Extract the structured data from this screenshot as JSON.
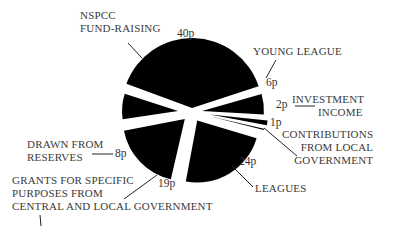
{
  "chart_data": {
    "type": "pie",
    "title": "",
    "unit": "p",
    "exploded": true,
    "categories": [
      "NSPCC FUND-RAISING",
      "YOUNG LEAGUE",
      "INVESTMENT INCOME",
      "CONTRIBUTIONS FROM LOCAL GOVERNMENT",
      "LEAGUES",
      "GRANTS FOR SPECIFIC PURPOSES FROM CENTRAL AND LOCAL GOVERNMENT",
      "DRAWN FROM RESERVES"
    ],
    "values": [
      40,
      6,
      2,
      1,
      24,
      19,
      8
    ],
    "value_labels": [
      "40p",
      "6p",
      "2p",
      "1p",
      "24p",
      "19p",
      "8p"
    ],
    "color": "#000000"
  },
  "labels": {
    "nspcc": [
      "NSPCC",
      "FUND-RAISING"
    ],
    "young": [
      "YOUNG LEAGUE"
    ],
    "investment": [
      "INVESTMENT",
      "INCOME"
    ],
    "contrib": [
      "CONTRIBUTIONS",
      "FROM LOCAL",
      "GOVERNMENT"
    ],
    "leagues": [
      "LEAGUES"
    ],
    "grants": [
      "GRANTS FOR SPECIFIC",
      "PURPOSES FROM",
      "CENTRAL AND LOCAL GOVERNMENT"
    ],
    "reserves": [
      "DRAWN FROM",
      "RESERVES"
    ]
  },
  "values": {
    "nspcc": "40p",
    "young": "6p",
    "investment": "2p",
    "contrib": "1p",
    "leagues": "24p",
    "grants": "19p",
    "reserves": "8p"
  }
}
